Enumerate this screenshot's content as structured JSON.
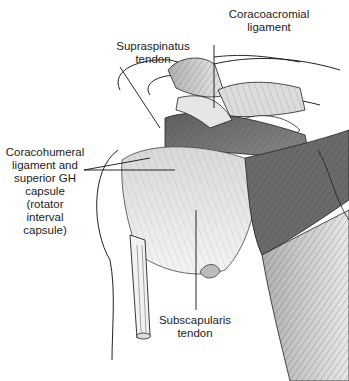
{
  "figure": {
    "labels": {
      "coracoacromial": [
        "Coracoacromial",
        "ligament"
      ],
      "supraspinatus": [
        "Supraspinatus",
        "tendon"
      ],
      "coracohumeral": [
        "Coracohumeral",
        "ligament and",
        "superior GH",
        "capsule",
        "(rotator",
        "interval",
        "capsule)"
      ],
      "subscapularis": [
        "Subscapularis",
        "tendon"
      ]
    }
  },
  "colors": {
    "background": "#ffffff",
    "line": "#222222",
    "muscle_dark": "#6e6e6e",
    "muscle_mid": "#9a9a9a",
    "muscle_light": "#cfcfcf"
  }
}
